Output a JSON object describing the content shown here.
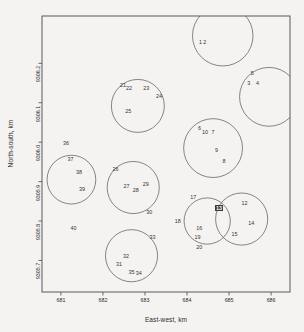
{
  "chart_data": {
    "type": "scatter",
    "title": "",
    "xlabel": "East-west, km",
    "ylabel": "North-south, km",
    "xlim": [
      680.55,
      686.45
    ],
    "ylim": [
      9305.62,
      9306.32
    ],
    "xticks": [
      681,
      682,
      683,
      684,
      685,
      686
    ],
    "xticklabels": [
      "681",
      "682",
      "683",
      "684",
      "685",
      "686"
    ],
    "yticks": [
      9306.2,
      9306.1,
      9306.0,
      9305.9,
      9305.8,
      9305.7
    ],
    "yticklabels": [
      "9306.2",
      "9306.1",
      "9306.0",
      "9305.9",
      "9305.8",
      "9305.7"
    ],
    "grid": false,
    "legend": false,
    "frame": true,
    "highlighted_point": "13",
    "points": [
      {
        "label": "1",
        "x": 684.32,
        "y": 9306.255
      },
      {
        "label": "2",
        "x": 684.42,
        "y": 9306.255
      },
      {
        "label": "5",
        "x": 685.55,
        "y": 9306.175
      },
      {
        "label": "3",
        "x": 685.47,
        "y": 9306.15
      },
      {
        "label": "4",
        "x": 685.68,
        "y": 9306.15
      },
      {
        "label": "6",
        "x": 684.3,
        "y": 9306.035
      },
      {
        "label": "10",
        "x": 684.43,
        "y": 9306.025
      },
      {
        "label": "7",
        "x": 684.62,
        "y": 9306.025
      },
      {
        "label": "9",
        "x": 684.7,
        "y": 9305.98
      },
      {
        "label": "8",
        "x": 684.88,
        "y": 9305.952
      },
      {
        "label": "17",
        "x": 684.15,
        "y": 9305.862
      },
      {
        "label": "12",
        "x": 685.37,
        "y": 9305.845
      },
      {
        "label": "13",
        "x": 684.76,
        "y": 9305.832
      },
      {
        "label": "18",
        "x": 683.78,
        "y": 9305.8
      },
      {
        "label": "14",
        "x": 685.53,
        "y": 9305.795
      },
      {
        "label": "16",
        "x": 684.29,
        "y": 9305.782
      },
      {
        "label": "19",
        "x": 684.25,
        "y": 9305.76
      },
      {
        "label": "15",
        "x": 685.13,
        "y": 9305.768
      },
      {
        "label": "20",
        "x": 684.29,
        "y": 9305.735
      },
      {
        "label": "21",
        "x": 682.48,
        "y": 9306.145
      },
      {
        "label": "22",
        "x": 682.62,
        "y": 9306.138
      },
      {
        "label": "23",
        "x": 683.03,
        "y": 9306.138
      },
      {
        "label": "24",
        "x": 683.33,
        "y": 9306.118
      },
      {
        "label": "25",
        "x": 682.6,
        "y": 9306.078
      },
      {
        "label": "36",
        "x": 681.12,
        "y": 9305.998
      },
      {
        "label": "37",
        "x": 681.23,
        "y": 9305.958
      },
      {
        "label": "38",
        "x": 681.43,
        "y": 9305.925
      },
      {
        "label": "39",
        "x": 681.5,
        "y": 9305.882
      },
      {
        "label": "26",
        "x": 682.3,
        "y": 9305.932
      },
      {
        "label": "27",
        "x": 682.56,
        "y": 9305.89
      },
      {
        "label": "29",
        "x": 683.02,
        "y": 9305.893
      },
      {
        "label": "28",
        "x": 682.78,
        "y": 9305.878
      },
      {
        "label": "30",
        "x": 683.1,
        "y": 9305.822
      },
      {
        "label": "40",
        "x": 681.3,
        "y": 9305.782
      },
      {
        "label": "33",
        "x": 683.18,
        "y": 9305.76
      },
      {
        "label": "32",
        "x": 682.55,
        "y": 9305.712
      },
      {
        "label": "31",
        "x": 682.38,
        "y": 9305.69
      },
      {
        "label": "35",
        "x": 682.68,
        "y": 9305.672
      },
      {
        "label": "34",
        "x": 682.85,
        "y": 9305.668
      }
    ],
    "circles": [
      {
        "name": "cluster-21-25",
        "cx": 682.83,
        "cy": 9306.092,
        "r": 0.63
      },
      {
        "name": "cluster-1-2",
        "cx": 684.85,
        "cy": 9306.27,
        "r": 0.72
      },
      {
        "name": "cluster-3-5",
        "cx": 685.95,
        "cy": 9306.115,
        "r": 0.7
      },
      {
        "name": "cluster-6-10",
        "cx": 684.62,
        "cy": 9305.985,
        "r": 0.7
      },
      {
        "name": "cluster-36-39",
        "cx": 681.25,
        "cy": 9305.905,
        "r": 0.58
      },
      {
        "name": "cluster-26-30",
        "cx": 682.72,
        "cy": 9305.885,
        "r": 0.62
      },
      {
        "name": "cluster-17-20",
        "cx": 684.48,
        "cy": 9305.8,
        "r": 0.55
      },
      {
        "name": "cluster-12-15",
        "cx": 685.3,
        "cy": 9305.805,
        "r": 0.62
      },
      {
        "name": "cluster-31-35",
        "cx": 682.68,
        "cy": 9305.712,
        "r": 0.62
      }
    ]
  }
}
